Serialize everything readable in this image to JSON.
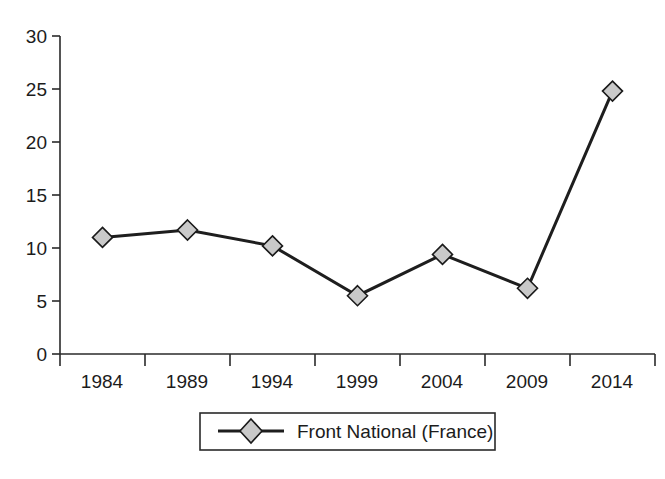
{
  "chart_data": {
    "type": "line",
    "title": "",
    "subtitle": "",
    "xlabel": "",
    "ylabel": "",
    "categories": [
      "1984",
      "1989",
      "1994",
      "1999",
      "2004",
      "2009",
      "2014"
    ],
    "series": [
      {
        "name": "Front National (France)",
        "values": [
          11.0,
          11.7,
          10.2,
          5.5,
          9.4,
          6.2,
          24.8
        ],
        "marker": "diamond",
        "marker_fill": "#c9c9c9",
        "line_color": "#1e1e1e"
      }
    ],
    "ylim": [
      0,
      30
    ],
    "ytick_values": [
      0,
      5,
      10,
      15,
      20,
      25,
      30
    ],
    "ytick_labels": [
      "0",
      "5",
      "10",
      "15",
      "20",
      "25",
      "30"
    ],
    "xtick_labels": [
      "1984",
      "1989",
      "1994",
      "1999",
      "2004",
      "2009",
      "2014"
    ],
    "grid": false,
    "legend_position": "bottom-center",
    "legend_entries": [
      "Front National (France)"
    ]
  },
  "legend": {
    "entry_label": "Front National (France)",
    "marker_icon": "diamond-marker-icon"
  },
  "axes": {
    "y_axis_name": "value-axis",
    "x_axis_name": "category-axis"
  },
  "colors": {
    "line": "#1e1e1e",
    "marker_fill": "#c9c9c9",
    "axis": "#2a2a2a",
    "text": "#1c1c1c",
    "background": "#ffffff"
  }
}
